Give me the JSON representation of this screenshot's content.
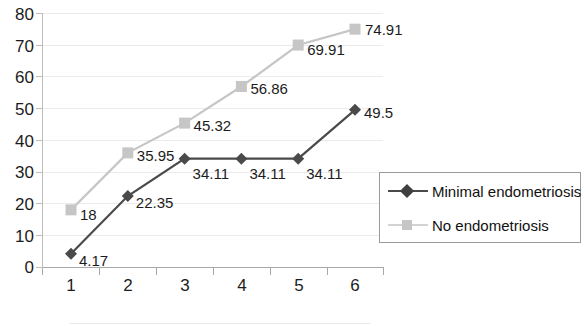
{
  "chart_data": {
    "type": "line",
    "title": "",
    "subtitle": "",
    "xlabel": "",
    "ylabel": "",
    "xlim": [
      0.5,
      6.5
    ],
    "ylim": [
      0,
      80
    ],
    "ytick_step": 10,
    "grid": true,
    "legend_position": "right",
    "categories": [
      "1",
      "2",
      "3",
      "4",
      "5",
      "6"
    ],
    "y_ticks": [
      "80",
      "70",
      "60",
      "50",
      "40",
      "30",
      "20",
      "10",
      "0"
    ],
    "series": [
      {
        "name": "Minimal endometriosis",
        "color": "#4a4a4a",
        "marker": "diamond",
        "values": [
          4.17,
          22.35,
          34.11,
          34.11,
          34.11,
          49.5
        ],
        "labels": [
          "4.17",
          "22.35",
          "34.11",
          "34.11",
          "34.11",
          "49.5"
        ]
      },
      {
        "name": "No endometriosis",
        "color": "#c6c6c6",
        "marker": "square",
        "values": [
          18,
          35.95,
          45.32,
          56.86,
          69.91,
          74.91
        ],
        "labels": [
          "18",
          "35.95",
          "45.32",
          "56.86",
          "69.91",
          "74.91"
        ]
      }
    ]
  },
  "legend": {
    "items": [
      {
        "label": "Minimal endometriosis"
      },
      {
        "label": "No endometriosis"
      }
    ]
  }
}
